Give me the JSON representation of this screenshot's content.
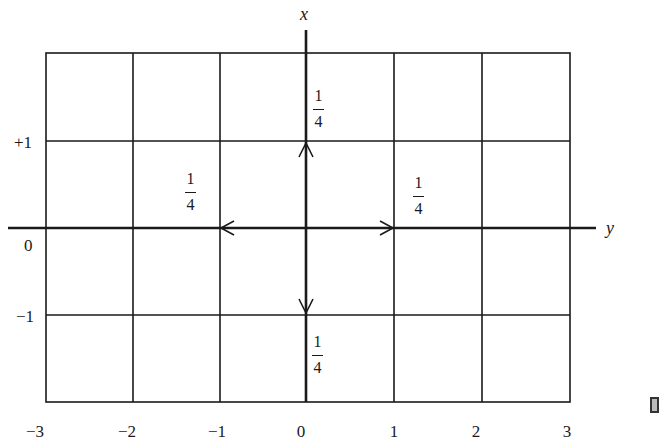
{
  "diagram": {
    "axes": {
      "horizontal_name": "y",
      "vertical_name": "x"
    },
    "horizontal_ticks": [
      "−3",
      "−2",
      "−1",
      "0",
      "1",
      "2",
      "3"
    ],
    "vertical_ticks": [
      "+1",
      "0",
      "−1"
    ],
    "transitions": [
      {
        "direction": "up",
        "to": "(x=+1, y=0)",
        "probability_num": "1",
        "probability_den": "4"
      },
      {
        "direction": "left",
        "to": "(x=0, y=−1)",
        "probability_num": "1",
        "probability_den": "4"
      },
      {
        "direction": "right",
        "to": "(x=0, y=1)",
        "probability_num": "1",
        "probability_den": "4"
      },
      {
        "direction": "down",
        "to": "(x=−1, y=0)",
        "probability_num": "1",
        "probability_den": "4"
      }
    ],
    "line_color": "#1a1a1a"
  }
}
